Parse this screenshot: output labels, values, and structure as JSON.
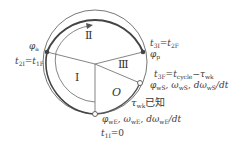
{
  "diagram": {
    "type": "cycle-phase-circle",
    "regions": [
      {
        "id": "I",
        "label": "Ⅰ"
      },
      {
        "id": "II",
        "label": "Ⅱ"
      },
      {
        "id": "III",
        "label": "Ⅲ"
      },
      {
        "id": "O",
        "label": "O"
      }
    ],
    "points": {
      "phi_a": {
        "label": "φ",
        "sub": "a"
      },
      "phi_p": {
        "label": "φ",
        "sub": "p"
      },
      "t2I": {
        "left": "t",
        "left_sub": "2I",
        "eq": "=",
        "right": "t",
        "right_sub": "1F"
      },
      "t3I": {
        "left": "t",
        "left_sub": "3I",
        "eq": "=",
        "right": "t",
        "right_sub": "2F"
      },
      "t3F": {
        "left": "t",
        "left_sub": "3F",
        "eq": "=",
        "mid": "t",
        "mid_sub": "cycle",
        "minus": "−",
        "right": "τ",
        "right_sub": "wk"
      },
      "wS": {
        "a": "φ",
        "a_sub": "wS",
        "sep1": ", ",
        "b": "ω",
        "b_sub": "wS",
        "sep2": ", ",
        "c": "dω",
        "c_sub": "wS",
        "c_tail": "/dt"
      },
      "tau_wk": {
        "sym": "τ",
        "sub": "wk",
        "text": "已知"
      },
      "wE": {
        "a": "φ",
        "a_sub": "wE",
        "sep1": ", ",
        "b": "ω",
        "b_sub": "wE",
        "sep2": ", ",
        "c": "dω",
        "c_sub": "wE",
        "c_tail": "/dt"
      },
      "t1I": {
        "left": "t",
        "left_sub": "1I",
        "eq": "=0"
      }
    }
  }
}
